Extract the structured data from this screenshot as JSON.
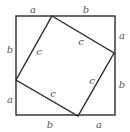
{
  "diagram": {
    "colors": {
      "stroke": "#2b2b2b",
      "label": "#555555",
      "background": "#ffffff"
    },
    "outer_square": {
      "x": 16,
      "y": 16,
      "size": 99,
      "stroke_width": 1.4
    },
    "inner_square": {
      "vertices": [
        {
          "x": 52,
          "y": 16
        },
        {
          "x": 114,
          "y": 53
        },
        {
          "x": 78,
          "y": 116
        },
        {
          "x": 16,
          "y": 80
        }
      ],
      "stroke_width": 1.4
    },
    "labels": {
      "top_a": {
        "text": "a",
        "x": 33,
        "y": 10
      },
      "top_b": {
        "text": "b",
        "x": 86,
        "y": 10
      },
      "right_a": {
        "text": "a",
        "x": 122,
        "y": 36
      },
      "right_b": {
        "text": "b",
        "x": 122,
        "y": 85
      },
      "bottom_a": {
        "text": "a",
        "x": 99,
        "y": 125
      },
      "bottom_b": {
        "text": "b",
        "x": 50,
        "y": 125
      },
      "left_b": {
        "text": "b",
        "x": 10,
        "y": 50
      },
      "left_a": {
        "text": "a",
        "x": 10,
        "y": 100
      },
      "c_top": {
        "text": "c",
        "x": 81,
        "y": 42
      },
      "c_right": {
        "text": "c",
        "x": 92,
        "y": 81
      },
      "c_bottom": {
        "text": "c",
        "x": 53,
        "y": 94
      },
      "c_left": {
        "text": "c",
        "x": 39,
        "y": 52
      }
    }
  }
}
